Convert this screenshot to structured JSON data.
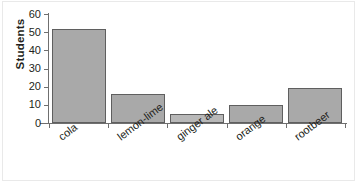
{
  "chart_data": {
    "type": "bar",
    "title": "",
    "xlabel": "",
    "ylabel": "Students",
    "categories": [
      "cola",
      "lemon-lime",
      "ginger ale",
      "orange",
      "rootbeer"
    ],
    "values": [
      52,
      16,
      5,
      10,
      19
    ],
    "ylim": [
      0,
      60
    ],
    "ytick_labels": [
      "0",
      "10",
      "20",
      "30",
      "40",
      "50",
      "60"
    ],
    "ytick_values": [
      0,
      10,
      20,
      30,
      40,
      50,
      60
    ],
    "grid": false,
    "legend": false,
    "series": [
      {
        "name": "Students",
        "values": [
          52,
          16,
          5,
          10,
          19
        ]
      }
    ]
  },
  "style": {
    "bar_fill": "#a9a9a9",
    "bar_fill_light": "#b8b8b8",
    "bar_border": "#5f5f5f",
    "axis_color": "#6f6f6f",
    "text_color": "#231f20",
    "background": "#ffffff"
  }
}
